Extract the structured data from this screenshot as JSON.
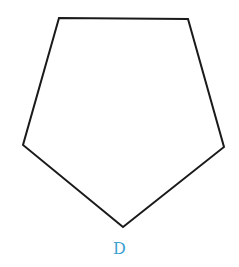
{
  "diagram": {
    "shape": "pentagon",
    "vertices": [
      [
        59,
        18
      ],
      [
        188,
        19
      ],
      [
        224,
        147
      ],
      [
        123,
        227
      ],
      [
        23,
        145
      ]
    ],
    "stroke_color": "#1a1a1a",
    "stroke_width": 2,
    "fill": "#ffffff"
  },
  "label": {
    "text": "D",
    "color": "#3d9fd3"
  }
}
